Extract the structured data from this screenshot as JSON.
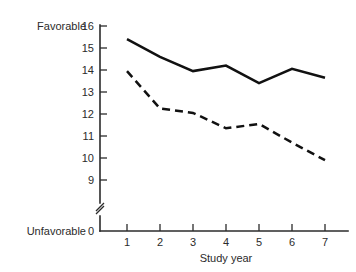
{
  "chart_data": {
    "type": "line",
    "title": "",
    "xlabel": "Study year",
    "ylabel": "",
    "x": [
      1,
      2,
      3,
      4,
      5,
      6,
      7
    ],
    "xtick_labels": [
      "1",
      "2",
      "3",
      "4",
      "5",
      "6",
      "7"
    ],
    "ytick_labels": [
      "0",
      "9",
      "10",
      "11",
      "12",
      "13",
      "14",
      "15",
      "16"
    ],
    "ylim": [
      9,
      16
    ],
    "y_axis_break": true,
    "y_axis_break_between": [
      0,
      9
    ],
    "y_low_anchor_label": "0",
    "scale_high_label": "Favorable",
    "scale_low_label": "Unfavorable",
    "grid": false,
    "legend": "none",
    "series": [
      {
        "name": "solid-series",
        "style": "solid",
        "color": "#111111",
        "values": [
          15.4,
          14.6,
          13.95,
          14.2,
          13.4,
          14.05,
          13.65
        ]
      },
      {
        "name": "dashed-series",
        "style": "dashed",
        "color": "#111111",
        "values": [
          13.95,
          12.25,
          12.05,
          11.35,
          11.55,
          10.7,
          9.9
        ]
      }
    ]
  },
  "labels": {
    "favorable": "Favorable",
    "unfavorable": "Unfavorable",
    "study_year": "Study year"
  }
}
